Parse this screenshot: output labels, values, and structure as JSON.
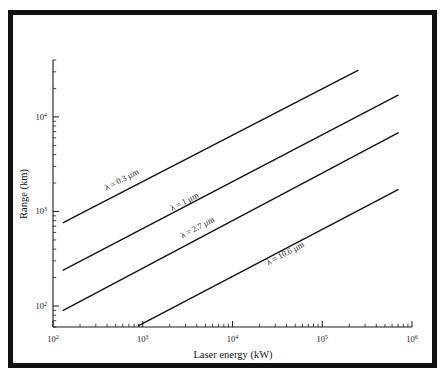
{
  "figure": {
    "background_color": "#ffffff",
    "border_color": "#111111",
    "line_color": "#111111"
  },
  "chart_data": {
    "type": "line",
    "title": "",
    "xlabel": "Laser energy (kW)",
    "ylabel": "Range (km)",
    "xscale": "log",
    "yscale": "log",
    "xlim": [
      100,
      1000000
    ],
    "ylim": [
      60,
      40000
    ],
    "grid": false,
    "legend_position": "inline-along-lines",
    "xticks": [
      {
        "value": 100,
        "mantissa": "10",
        "exponent": "2"
      },
      {
        "value": 1000,
        "mantissa": "10",
        "exponent": "3"
      },
      {
        "value": 10000,
        "mantissa": "10",
        "exponent": "4"
      },
      {
        "value": 100000,
        "mantissa": "10",
        "exponent": "5"
      },
      {
        "value": 1000000,
        "mantissa": "10",
        "exponent": "6"
      }
    ],
    "yticks": [
      {
        "value": 100,
        "mantissa": "10",
        "exponent": "2"
      },
      {
        "value": 1000,
        "mantissa": "10",
        "exponent": "3"
      },
      {
        "value": 10000,
        "mantissa": "10",
        "exponent": "4"
      }
    ],
    "series": [
      {
        "name": "lambda-0.3um",
        "label": "λ = 0.3 µm",
        "wavelength_um": 0.3,
        "x": [
          130,
          250000
        ],
        "y": [
          760,
          31000
        ],
        "label_x": 600,
        "label_y": 2050
      },
      {
        "name": "lambda-1um",
        "label": "λ = 1 µm",
        "wavelength_um": 1,
        "x": [
          130,
          700000
        ],
        "y": [
          240,
          17000
        ],
        "label_x": 3000,
        "label_y": 1200
      },
      {
        "name": "lambda-2.7um",
        "label": "λ = 2.7 µm",
        "wavelength_um": 2.7,
        "x": [
          130,
          700000
        ],
        "y": [
          90,
          6800
        ],
        "label_x": 4200,
        "label_y": 640
      },
      {
        "name": "lambda-10.6um",
        "label": "λ = 10.6 µm",
        "wavelength_um": 10.6,
        "x": [
          900,
          700000
        ],
        "y": [
          62,
          1700
        ],
        "label_x": 40000,
        "label_y": 340
      }
    ]
  }
}
